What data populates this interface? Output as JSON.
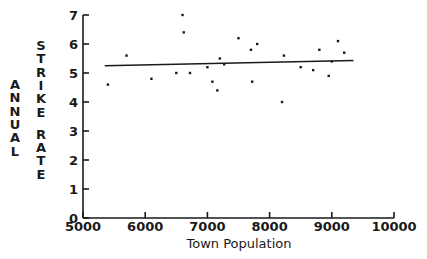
{
  "chart_data": {
    "type": "scatter",
    "title": "",
    "xlabel": "Town Population",
    "ylabel": "ANNUAL STRIKE RATE",
    "ylabel_outer": "ANNUAL",
    "ylabel_inner": "STRIKE RATE",
    "xlim": [
      5000,
      10000
    ],
    "ylim": [
      0,
      7
    ],
    "xticks": [
      5000,
      6000,
      7000,
      8000,
      9000,
      10000
    ],
    "xtick_labels": [
      "5000",
      "6000",
      "7000",
      "8000",
      "9000",
      "10000"
    ],
    "yticks": [
      0,
      1,
      2,
      3,
      4,
      5,
      6,
      7
    ],
    "ytick_labels": [
      "0",
      "1",
      "2",
      "3",
      "4",
      "5",
      "6",
      "7"
    ],
    "grid": false,
    "legend": null,
    "marker": "square",
    "marker_color": "#1a1a1a",
    "line_color": "#1a1a1a",
    "points": [
      {
        "x": 5400,
        "y": 4.6
      },
      {
        "x": 5700,
        "y": 5.6
      },
      {
        "x": 6100,
        "y": 4.8
      },
      {
        "x": 6500,
        "y": 5.0
      },
      {
        "x": 6600,
        "y": 7.0
      },
      {
        "x": 6620,
        "y": 6.4
      },
      {
        "x": 6720,
        "y": 5.0
      },
      {
        "x": 7000,
        "y": 5.2
      },
      {
        "x": 7080,
        "y": 4.7
      },
      {
        "x": 7160,
        "y": 4.4
      },
      {
        "x": 7200,
        "y": 5.5
      },
      {
        "x": 7270,
        "y": 5.3
      },
      {
        "x": 7500,
        "y": 6.2
      },
      {
        "x": 7700,
        "y": 5.8
      },
      {
        "x": 7720,
        "y": 4.7
      },
      {
        "x": 7800,
        "y": 6.0
      },
      {
        "x": 8200,
        "y": 4.0
      },
      {
        "x": 8230,
        "y": 5.6
      },
      {
        "x": 8500,
        "y": 5.2
      },
      {
        "x": 8700,
        "y": 5.1
      },
      {
        "x": 8800,
        "y": 5.8
      },
      {
        "x": 8950,
        "y": 4.9
      },
      {
        "x": 9000,
        "y": 5.4
      },
      {
        "x": 9100,
        "y": 6.1
      },
      {
        "x": 9200,
        "y": 5.7
      }
    ],
    "trendline": {
      "x_start": 5350,
      "y_start": 5.25,
      "x_end": 9350,
      "y_end": 5.43
    }
  }
}
